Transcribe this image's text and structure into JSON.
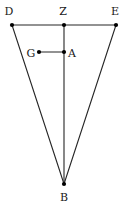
{
  "figure": {
    "type": "geometry-diagram",
    "width": 126,
    "height": 208,
    "background_color": "#ffffff",
    "stroke_color": "#262626",
    "point_color": "#000000",
    "label_color": "#1a1a1a",
    "stroke_width": 1.1,
    "point_radius": 2.1
  },
  "points": [
    {
      "id": "D",
      "label": "D",
      "x": 12,
      "y": 25,
      "label_x": 9,
      "label_y": 11,
      "marker": true
    },
    {
      "id": "Z",
      "label": "Z",
      "x": 64,
      "y": 25,
      "label_x": 63,
      "label_y": 11,
      "marker": true
    },
    {
      "id": "E",
      "label": "E",
      "x": 116,
      "y": 25,
      "label_x": 115,
      "label_y": 11,
      "marker": true
    },
    {
      "id": "G",
      "label": "G",
      "x": 39,
      "y": 52,
      "label_x": 31,
      "label_y": 53,
      "marker": true
    },
    {
      "id": "A",
      "label": "A",
      "x": 64,
      "y": 52,
      "label_x": 72,
      "label_y": 53,
      "marker": true
    },
    {
      "id": "B",
      "label": "B",
      "x": 64,
      "y": 184,
      "label_x": 64,
      "label_y": 197,
      "marker": true
    }
  ],
  "segments": [
    {
      "id": "DE",
      "from": "D",
      "to": "E",
      "name": "segment-d-e"
    },
    {
      "id": "DB",
      "from": "D",
      "to": "B",
      "name": "segment-d-b"
    },
    {
      "id": "EB",
      "from": "E",
      "to": "B",
      "name": "segment-e-b"
    },
    {
      "id": "ZB",
      "from": "Z",
      "to": "B",
      "name": "segment-z-b"
    },
    {
      "id": "GA",
      "from": "G",
      "to": "A",
      "name": "segment-g-a"
    }
  ]
}
